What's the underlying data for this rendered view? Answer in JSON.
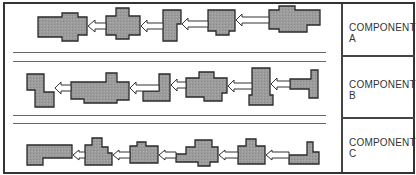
{
  "diagram": {
    "type": "component-sequence-diagram",
    "colors": {
      "frame": "#333333",
      "shape_fill": "#9a9a9a",
      "shape_stroke": "#2a2a2a",
      "arrow_fill": "#ffffff",
      "divider": "#666666"
    },
    "rows": [
      {
        "id": "A",
        "label_line1": "COMPONENT",
        "label_line2": "A",
        "part_count": 5,
        "arrow_count": 4,
        "arrow_direction": "right-to-left"
      },
      {
        "id": "B",
        "label_line1": "COMPONENT",
        "label_line2": "B",
        "part_count": 6,
        "arrow_count": 5,
        "arrow_direction": "right-to-left"
      },
      {
        "id": "C",
        "label_line1": "COMPONENT",
        "label_line2": "C",
        "part_count": 6,
        "arrow_count": 5,
        "arrow_direction": "right-to-left"
      }
    ]
  }
}
